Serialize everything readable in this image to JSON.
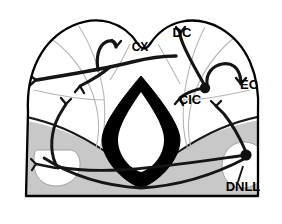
{
  "figure": {
    "background_color": "#ffffff",
    "outline_color": "#000000",
    "neuron_color": "#1a1a1a",
    "shading": {
      "tegmentum_gray": "#c8c8c8",
      "periaqueductal_black": "#000000",
      "aqueduct_white": "#ffffff",
      "subdivision_line_gray": "#b0b0b0",
      "lobe_white": "#ffffff"
    }
  },
  "labels": [
    {
      "id": "cx",
      "text": "CX",
      "x": 140,
      "y": 51,
      "size": 12,
      "anchor": "middle",
      "meaning": "cortex-of-inferior-colliculus"
    },
    {
      "id": "dc",
      "text": "DC",
      "x": 182,
      "y": 37,
      "size": 13,
      "anchor": "middle",
      "meaning": "dorsal-cortex"
    },
    {
      "id": "ec",
      "text": "EC",
      "x": 249,
      "y": 89,
      "size": 13,
      "anchor": "middle",
      "meaning": "external-cortex"
    },
    {
      "id": "cic",
      "text": "CIC",
      "x": 190,
      "y": 104,
      "size": 13,
      "anchor": "middle",
      "meaning": "central-nucleus-of-inferior-colliculus"
    },
    {
      "id": "dnll",
      "text": "DNLL",
      "x": 243,
      "y": 191,
      "size": 13,
      "anchor": "middle",
      "meaning": "dorsal-nucleus-of-lateral-lemniscus"
    }
  ],
  "leader_lines": [
    {
      "id": "dnll-leader",
      "from_x": 238,
      "from_y": 182,
      "to_x": 243,
      "to_y": 166
    }
  ],
  "somata": [
    {
      "id": "cic-soma",
      "x": 205,
      "y": 88,
      "r": 5.2,
      "region": "CIC"
    },
    {
      "id": "dnll-soma",
      "x": 246,
      "y": 155,
      "r": 5.6,
      "region": "DNLL"
    }
  ],
  "regions": [
    {
      "id": "outer-boundary",
      "name": "inferior-colliculus-outline"
    },
    {
      "id": "tegmentum",
      "name": "ventral-tegmentum-shaded"
    },
    {
      "id": "periaqueductal-gray",
      "name": "periaqueductal-gray-dark-diamond"
    },
    {
      "id": "aqueduct",
      "name": "cerebral-aqueduct-white-teardrop"
    },
    {
      "id": "dnll-left-oval",
      "name": "dnll-left-white-oval"
    },
    {
      "id": "dnll-right-oval",
      "name": "dnll-right-white-oval"
    }
  ]
}
